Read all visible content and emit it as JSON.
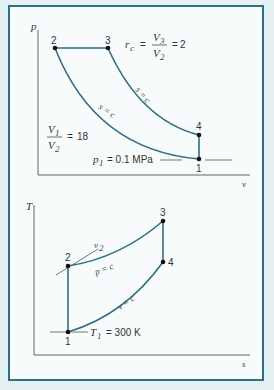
{
  "colors": {
    "process_line": "#2f6f86",
    "axis": "#555555",
    "frame_border": "#2f6f86",
    "background": "#e6f1f4",
    "panel": "#f7fbfb"
  },
  "pv_diagram": {
    "y_axis_label": "p",
    "x_axis_label": "v",
    "points": [
      {
        "label": "1"
      },
      {
        "label": "2"
      },
      {
        "label": "3"
      },
      {
        "label": "4"
      }
    ],
    "process_labels": {
      "compression": "s = c",
      "expansion": "s = c"
    },
    "cutoff_ratio": {
      "symbol": "r",
      "sub": "c",
      "numerator": "V3",
      "denominator": "V2",
      "value": "2"
    },
    "compression_ratio": {
      "numerator": "V1",
      "denominator": "V2",
      "value": "18"
    },
    "p1_label": {
      "symbol": "p",
      "sub": "1",
      "text": "= 0.1 MPa"
    }
  },
  "ts_diagram": {
    "y_axis_label": "T",
    "x_axis_label": "s",
    "points": [
      {
        "label": "1"
      },
      {
        "label": "2"
      },
      {
        "label": "3"
      },
      {
        "label": "4"
      }
    ],
    "process_labels": {
      "heat_addition": "p = c",
      "heat_rejection": "v = c"
    },
    "v2_label": {
      "symbol": "v",
      "sub": "2"
    },
    "t1_label": {
      "symbol": "T",
      "sub": "1",
      "text": "= 300 K"
    }
  }
}
